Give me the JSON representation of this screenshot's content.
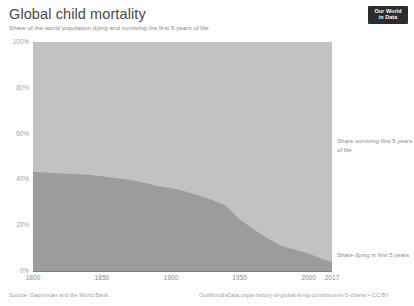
{
  "header": {
    "title": "Global child mortality",
    "subtitle": "Share of the world population dying and surviving the first 5 years of life.",
    "logo_line1": "Our World",
    "logo_line2": "in Data"
  },
  "footer": {
    "source": "Source: Gapminder and the World Bank.",
    "link": "OurWorldInData.org/a-history-of-global-living-conditions-in-5-charts/ • CC BY"
  },
  "annotations": {
    "surviving": "Share surviving first 5 years of life",
    "dying": "Share dying in first 5 years"
  },
  "colors": {
    "area_surviving": "#c2c2c2",
    "area_dying": "#9c9c9c",
    "axis": "#7e7e7e",
    "tick_text": "#a5a5a5",
    "title_text": "#4a4a4a",
    "subtitle_text": "#8c8c8c",
    "logo_bg": "#2b2b2b",
    "logo_text": "#ffffff",
    "background": "#fdfdfd"
  },
  "chart_data": {
    "type": "area",
    "title": "Global child mortality",
    "subtitle": "Share of the world population dying and surviving the first 5 years of life.",
    "xlabel": "",
    "ylabel": "",
    "stacked": true,
    "grid": false,
    "legend_position": "right-inline-labels",
    "xlim": [
      1800,
      2017
    ],
    "ylim": [
      0,
      100
    ],
    "xticks": [
      1800,
      1850,
      1900,
      1950,
      2000,
      2017
    ],
    "xtick_labels": [
      "1800",
      "1850",
      "1900",
      "1950",
      "2000",
      "2017"
    ],
    "yticks": [
      0,
      20,
      40,
      60,
      80,
      100
    ],
    "ytick_labels": [
      "0%",
      "20%",
      "40%",
      "60%",
      "80%",
      "100%"
    ],
    "x": [
      1800,
      1810,
      1820,
      1830,
      1840,
      1850,
      1860,
      1870,
      1880,
      1890,
      1900,
      1910,
      1920,
      1930,
      1940,
      1950,
      1960,
      1970,
      1980,
      1990,
      2000,
      2010,
      2017
    ],
    "series": [
      {
        "name": "Share dying in first 5 years",
        "color": "#9c9c9c",
        "values": [
          43.3,
          43.0,
          42.6,
          42.4,
          42.0,
          41.4,
          40.5,
          39.8,
          38.7,
          37.1,
          36.2,
          34.8,
          33.0,
          31.0,
          28.6,
          22.5,
          18.2,
          14.3,
          11.0,
          9.3,
          7.6,
          5.2,
          3.9
        ]
      },
      {
        "name": "Share surviving first 5 years of life",
        "color": "#c2c2c2",
        "values": [
          56.7,
          57.0,
          57.4,
          57.6,
          58.0,
          58.6,
          59.5,
          60.2,
          61.3,
          62.9,
          63.8,
          65.2,
          67.0,
          69.0,
          71.4,
          77.5,
          81.8,
          85.7,
          89.0,
          90.7,
          92.4,
          94.8,
          96.1
        ]
      }
    ]
  }
}
